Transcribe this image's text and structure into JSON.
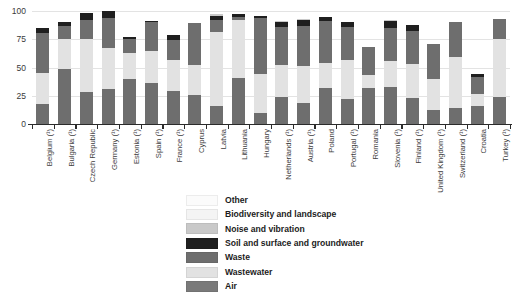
{
  "chart_data": {
    "type": "bar",
    "variant": "stacked-vertical",
    "title": "",
    "subtitle": "",
    "xlabel": "",
    "ylabel": "",
    "ylim": [
      0,
      100
    ],
    "yticks": [
      0,
      25,
      50,
      75,
      100
    ],
    "ytick_labels": [
      "0",
      "25",
      "50",
      "75",
      "100"
    ],
    "grid": true,
    "grid_axis": "y",
    "legend_position": "bottom-center",
    "stack_order_bottom_to_top": [
      "Air",
      "Wastewater",
      "Waste",
      "Soil and surface and groundwater",
      "Noise and vibration",
      "Biodiversity and landscape",
      "Other"
    ],
    "categories": [
      "Belgium (¹)",
      "Bulgaria (¹)",
      "Czech Republic",
      "Germany (¹)",
      "Estonia (¹)",
      "Spain (¹)",
      "France (¹)",
      "Cyprus",
      "Latvia",
      "Lithuania",
      "Hungary",
      "Netherlands (¹)",
      "Austria (¹)",
      "Poland",
      "Portugal (¹)",
      "Romania",
      "Slovenia (¹)",
      "Finland (¹)",
      "United Kingdom (¹)",
      "Switzerland (¹)",
      "Croatia",
      "Turkey (¹)"
    ],
    "series": [
      {
        "name": "Air",
        "color": "#6e6e6e",
        "values": [
          18,
          49,
          28,
          31,
          40,
          36,
          29,
          26,
          16,
          41,
          10,
          24,
          19,
          32,
          22,
          32,
          33,
          23,
          12,
          14,
          16,
          24
        ]
      },
      {
        "name": "Wastewater",
        "color": "#e2e2e2",
        "values": [
          27,
          26,
          47,
          36,
          23,
          29,
          28,
          26,
          65,
          51,
          34,
          28,
          32,
          22,
          35,
          11,
          23,
          30,
          28,
          45,
          11,
          51
        ]
      },
      {
        "name": "Waste",
        "color": "#6e6e6e",
        "values": [
          36,
          12,
          17,
          27,
          12,
          25,
          17,
          37,
          11,
          3,
          50,
          34,
          36,
          37,
          29,
          25,
          29,
          29,
          31,
          31,
          15,
          18
        ]
      },
      {
        "name": "Soil and surface and groundwater",
        "color": "#1f1f1f",
        "values": [
          4,
          3,
          6,
          6,
          2,
          1,
          5,
          0,
          4,
          2,
          2,
          4,
          5,
          4,
          4,
          0,
          6,
          6,
          0,
          0,
          2,
          0
        ]
      },
      {
        "name": "Noise and vibration",
        "color": "#c9c9c9",
        "values": [
          0,
          0,
          0,
          0,
          0,
          0,
          0,
          0,
          1,
          0,
          0,
          1,
          1,
          0,
          0,
          0,
          1,
          0,
          0,
          0,
          0,
          0
        ]
      },
      {
        "name": "Biodiversity and landscape",
        "color": "#f4f4f4",
        "values": [
          0,
          0,
          0,
          0,
          0,
          0,
          0,
          0,
          0,
          0,
          0,
          0,
          0,
          0,
          0,
          0,
          0,
          0,
          0,
          0,
          0,
          0
        ]
      },
      {
        "name": "Other",
        "color": "#fbfbfb",
        "values": [
          0,
          0,
          0,
          0,
          0,
          0,
          0,
          0,
          0,
          0,
          0,
          0,
          0,
          0,
          0,
          0,
          0,
          0,
          0,
          0,
          0,
          0
        ]
      }
    ],
    "totals": [
      85,
      90,
      98,
      100,
      77,
      91,
      79,
      89,
      97,
      97,
      96,
      91,
      93,
      95,
      90,
      68,
      92,
      88,
      71,
      90,
      44,
      93
    ]
  },
  "legend": {
    "items": [
      {
        "label": "Other",
        "color": "#fbfbfb"
      },
      {
        "label": "Biodiversity and landscape",
        "color": "#f4f4f4"
      },
      {
        "label": "Noise and vibration",
        "color": "#c9c9c9"
      },
      {
        "label": "Soil and surface and groundwater",
        "color": "#1f1f1f"
      },
      {
        "label": "Waste",
        "color": "#6e6e6e"
      },
      {
        "label": "Wastewater",
        "color": "#e2e2e2"
      },
      {
        "label": "Air",
        "color": "#7a7a7a"
      }
    ]
  }
}
